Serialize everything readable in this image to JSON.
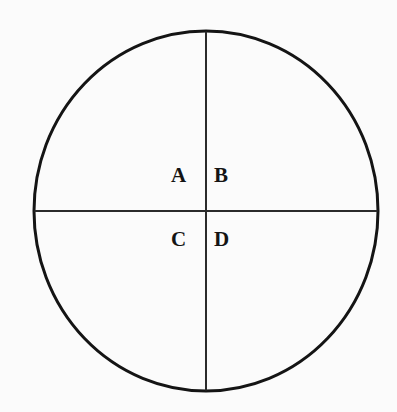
{
  "figure": {
    "canvas": {
      "width": 397,
      "height": 412,
      "background_color": "#fbfbfb"
    },
    "shape": {
      "name": "circle-outline",
      "type": "ellipse",
      "center_x": 206,
      "center_y": 211,
      "radius_x": 172,
      "radius_y": 180,
      "stroke_color": "#141414",
      "stroke_width": 3,
      "fill": "none"
    },
    "dividers": [
      {
        "name": "vertical-diameter",
        "orientation": "vertical",
        "x": 206,
        "y1": 31,
        "y2": 391,
        "stroke_color": "#2b2b2b",
        "stroke_width": 2
      },
      {
        "name": "horizontal-diameter",
        "orientation": "horizontal",
        "y": 211,
        "x1": 34,
        "x2": 378,
        "stroke_color": "#2b2b2b",
        "stroke_width": 2
      }
    ],
    "labels": {
      "a": "A",
      "b": "B",
      "c": "C",
      "d": "D"
    },
    "label_positions": {
      "a": "upper-left",
      "b": "upper-right",
      "c": "lower-left",
      "d": "lower-right"
    }
  }
}
